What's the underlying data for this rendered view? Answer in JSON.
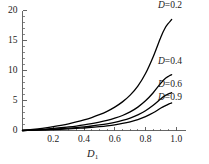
{
  "chart_data": {
    "type": "line",
    "title": "",
    "subtitle": "",
    "xlabel": "D1",
    "xlabel_display": "D",
    "xlabel_sub": "1",
    "ylabel": "",
    "xlim": [
      0.0,
      1.0
    ],
    "ylim": [
      0,
      20
    ],
    "grid": false,
    "legend_position": "inline-right",
    "x_ticks": [
      0.2,
      0.4,
      0.6,
      0.8,
      1.0
    ],
    "x_tick_labels": [
      "0.2",
      "0.4",
      "0.6",
      "0.8",
      "1.0"
    ],
    "x_minor_ticks": [
      0.05,
      0.1,
      0.15,
      0.25,
      0.3,
      0.35,
      0.45,
      0.5,
      0.55,
      0.65,
      0.7,
      0.75,
      0.85,
      0.9,
      0.95
    ],
    "y_ticks": [
      0,
      5,
      10,
      15,
      20
    ],
    "y_tick_labels": [
      "0",
      "5",
      "10",
      "15",
      "20"
    ],
    "y_minor_ticks": [
      1,
      2,
      3,
      4,
      6,
      7,
      8,
      9,
      11,
      12,
      13,
      14,
      16,
      17,
      18,
      19
    ],
    "line_color": "#000000",
    "line_width": 1.3,
    "axis_color": "#555555",
    "background": "#ffffff",
    "series": [
      {
        "name": "D=0.2",
        "label_display": "D",
        "label_rest": "=0.2",
        "x": [
          0.0,
          0.05,
          0.1,
          0.15,
          0.2,
          0.25,
          0.3,
          0.35,
          0.4,
          0.45,
          0.5,
          0.55,
          0.6,
          0.65,
          0.7,
          0.75,
          0.8,
          0.85,
          0.9,
          0.93,
          0.95,
          0.96,
          0.97
        ],
        "values": [
          0.0,
          0.13,
          0.28,
          0.45,
          0.65,
          0.87,
          1.12,
          1.42,
          1.76,
          2.16,
          2.63,
          3.2,
          3.9,
          4.77,
          5.9,
          7.4,
          9.5,
          12.3,
          15.6,
          17.2,
          17.9,
          18.2,
          18.5
        ]
      },
      {
        "name": "D=0.4",
        "label_display": "D",
        "label_rest": "=0.4",
        "x": [
          0.0,
          0.05,
          0.1,
          0.15,
          0.2,
          0.25,
          0.3,
          0.35,
          0.4,
          0.45,
          0.5,
          0.55,
          0.6,
          0.65,
          0.7,
          0.75,
          0.8,
          0.85,
          0.9,
          0.93,
          0.95,
          0.96,
          0.97
        ],
        "values": [
          0.0,
          0.07,
          0.15,
          0.24,
          0.34,
          0.46,
          0.59,
          0.74,
          0.92,
          1.13,
          1.38,
          1.68,
          2.05,
          2.5,
          3.1,
          3.9,
          4.95,
          6.3,
          7.9,
          8.7,
          9.05,
          9.2,
          9.3
        ]
      },
      {
        "name": "D=0.6",
        "label_display": "D",
        "label_rest": "=0.6",
        "x": [
          0.0,
          0.05,
          0.1,
          0.15,
          0.2,
          0.25,
          0.3,
          0.35,
          0.4,
          0.45,
          0.5,
          0.55,
          0.6,
          0.65,
          0.7,
          0.75,
          0.8,
          0.85,
          0.9,
          0.93,
          0.95,
          0.96,
          0.97
        ],
        "values": [
          0.0,
          0.05,
          0.1,
          0.16,
          0.23,
          0.3,
          0.39,
          0.49,
          0.61,
          0.75,
          0.92,
          1.12,
          1.37,
          1.68,
          2.08,
          2.6,
          3.3,
          4.2,
          5.3,
          5.85,
          6.1,
          6.2,
          6.3
        ]
      },
      {
        "name": "D=0.9",
        "label_display": "D",
        "label_rest": "=0.9",
        "x": [
          0.0,
          0.05,
          0.1,
          0.15,
          0.2,
          0.25,
          0.3,
          0.35,
          0.4,
          0.45,
          0.5,
          0.55,
          0.6,
          0.65,
          0.7,
          0.75,
          0.8,
          0.85,
          0.9,
          0.93,
          0.95,
          0.96,
          0.97
        ],
        "values": [
          0.0,
          0.035,
          0.07,
          0.11,
          0.16,
          0.21,
          0.27,
          0.34,
          0.42,
          0.52,
          0.64,
          0.78,
          0.95,
          1.17,
          1.45,
          1.82,
          2.32,
          2.95,
          3.75,
          4.15,
          4.4,
          4.5,
          4.6
        ]
      }
    ],
    "curve_label_positions": [
      {
        "x": 0.92,
        "y": 20.8
      },
      {
        "x": 0.92,
        "y": 11.4
      },
      {
        "x": 0.92,
        "y": 7.6
      },
      {
        "x": 0.92,
        "y": 5.4
      }
    ]
  }
}
